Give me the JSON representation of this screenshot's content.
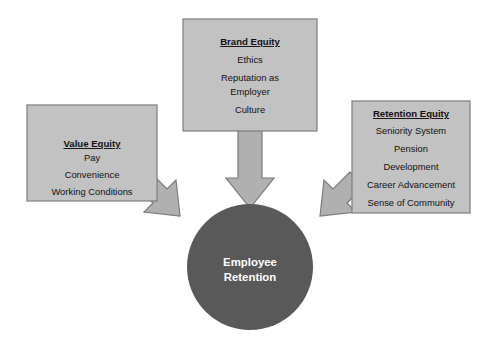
{
  "diagram": {
    "type": "convergent-arrow-diagram",
    "colors": {
      "box_fill": "#c2c2c2",
      "box_stroke": "#7d7d7d",
      "arrow_fill": "#b0b0b0",
      "arrow_stroke": "#7a7a7a",
      "hub_fill": "#595959",
      "hub_text": "#ffffff",
      "box_text": "#111111",
      "background": "#ffffff"
    },
    "hub": {
      "name": "employee-retention",
      "line1": "Employee",
      "line2": "Retention",
      "shape": "circle",
      "center": {
        "x": 250,
        "y": 267
      },
      "radius": 63
    },
    "boxes": [
      {
        "id": "value-equity",
        "title": "Value Equity",
        "items": [
          "Pay",
          "Convenience",
          "Working Conditions"
        ],
        "rect": {
          "x": 27,
          "y": 105,
          "width": 130,
          "height": 96
        }
      },
      {
        "id": "brand-equity",
        "title": "Brand Equity",
        "items": [
          "Ethics",
          "Reputation as",
          "Employer",
          "Culture"
        ],
        "rect": {
          "x": 183,
          "y": 19,
          "width": 134,
          "height": 112
        }
      },
      {
        "id": "retention-equity",
        "title": "Retention Equity",
        "items": [
          "Seniority System",
          "Pension",
          "Development",
          "Career Advancement",
          "Sense of Community"
        ],
        "rect": {
          "x": 352,
          "y": 101,
          "width": 118,
          "height": 112
        }
      }
    ],
    "arrows": [
      {
        "id": "value-to-hub",
        "from": "value-equity",
        "to": "employee-retention",
        "direction": "down-right"
      },
      {
        "id": "brand-to-hub",
        "from": "brand-equity",
        "to": "employee-retention",
        "direction": "down"
      },
      {
        "id": "retention-to-hub",
        "from": "retention-equity",
        "to": "employee-retention",
        "direction": "down-left"
      }
    ]
  }
}
